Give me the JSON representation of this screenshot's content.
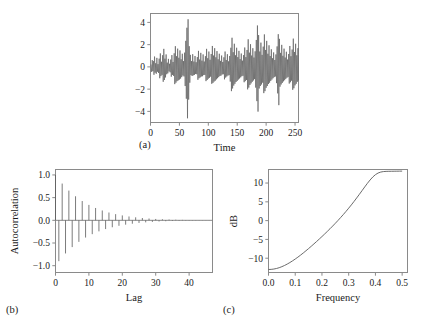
{
  "figure": {
    "background": "#ffffff",
    "line_color": "#5a5a5a",
    "axis_color": "#8a8a8a",
    "text_color": "#1a1a1a"
  },
  "panels": [
    {
      "id": "a",
      "label": "(a)",
      "xlabel": "Time",
      "ylabel": "",
      "xticks": [
        "0",
        "50",
        "100",
        "150",
        "200",
        "250"
      ],
      "yticks": [
        "-4",
        "-2",
        "0",
        "2",
        "4"
      ]
    },
    {
      "id": "b",
      "label": "(b)",
      "xlabel": "Lag",
      "ylabel": "Autocorrelation",
      "xticks": [
        "0",
        "10",
        "20",
        "30",
        "40"
      ],
      "yticks": [
        "1.0",
        "0.5",
        "0.0",
        "-0.5",
        "-1.0"
      ]
    },
    {
      "id": "c",
      "label": "(c)",
      "xlabel": "Frequency",
      "ylabel": "dB",
      "xticks": [
        "0.0",
        "0.1",
        "0.2",
        "0.3",
        "0.4",
        "0.5"
      ],
      "yticks": [
        "10",
        "5",
        "0",
        "-5",
        "-10"
      ]
    }
  ],
  "chart_data": [
    {
      "type": "line",
      "panel": "a",
      "title": "",
      "xlabel": "Time",
      "ylabel": "",
      "xlim": [
        0,
        256
      ],
      "ylim": [
        -5.0,
        4.8
      ],
      "xticks": [
        0,
        50,
        100,
        150,
        200,
        250
      ],
      "yticks": [
        -4,
        -2,
        0,
        2,
        4
      ],
      "grid": false,
      "legend": null,
      "description": "Simulated stationary time series of 256 observations, rapidly oscillating about zero with amplitude envelope mostly within -3 to 3 and occasional excursions to about -4.6 and 4.3.",
      "x": [
        1,
        2,
        3,
        4,
        5,
        6,
        7,
        8,
        9,
        10,
        11,
        12,
        13,
        14,
        15,
        16,
        17,
        18,
        19,
        20,
        21,
        22,
        23,
        24,
        25,
        26,
        27,
        28,
        29,
        30,
        31,
        32,
        33,
        34,
        35,
        36,
        37,
        38,
        39,
        40,
        41,
        42,
        43,
        44,
        45,
        46,
        47,
        48,
        49,
        50,
        51,
        52,
        53,
        54,
        55,
        56,
        57,
        58,
        59,
        60,
        61,
        62,
        63,
        64,
        65,
        66,
        67,
        68,
        69,
        70,
        71,
        72,
        73,
        74,
        75,
        76,
        77,
        78,
        79,
        80,
        81,
        82,
        83,
        84,
        85,
        86,
        87,
        88,
        89,
        90,
        91,
        92,
        93,
        94,
        95,
        96,
        97,
        98,
        99,
        100,
        101,
        102,
        103,
        104,
        105,
        106,
        107,
        108,
        109,
        110,
        111,
        112,
        113,
        114,
        115,
        116,
        117,
        118,
        119,
        120,
        121,
        122,
        123,
        124,
        125,
        126,
        127,
        128,
        129,
        130,
        131,
        132,
        133,
        134,
        135,
        136,
        137,
        138,
        139,
        140,
        141,
        142,
        143,
        144,
        145,
        146,
        147,
        148,
        149,
        150,
        151,
        152,
        153,
        154,
        155,
        156,
        157,
        158,
        159,
        160,
        161,
        162,
        163,
        164,
        165,
        166,
        167,
        168,
        169,
        170,
        171,
        172,
        173,
        174,
        175,
        176,
        177,
        178,
        179,
        180,
        181,
        182,
        183,
        184,
        185,
        186,
        187,
        188,
        189,
        190,
        191,
        192,
        193,
        194,
        195,
        196,
        197,
        198,
        199,
        200,
        201,
        202,
        203,
        204,
        205,
        206,
        207,
        208,
        209,
        210,
        211,
        212,
        213,
        214,
        215,
        216,
        217,
        218,
        219,
        220,
        221,
        222,
        223,
        224,
        225,
        226,
        227,
        228,
        229,
        230,
        231,
        232,
        233,
        234,
        235,
        236,
        237,
        238,
        239,
        240,
        241,
        242,
        243,
        244,
        245,
        246,
        247,
        248,
        249,
        250,
        251,
        252,
        253,
        254,
        255,
        256
      ],
      "values": [
        0.22,
        -0.45,
        0.61,
        -0.38,
        0.52,
        -0.71,
        0.93,
        -0.52,
        0.33,
        -0.62,
        0.81,
        -0.44,
        0.25,
        -0.55,
        0.74,
        -1.02,
        1.21,
        -0.83,
        0.46,
        -0.72,
        1.05,
        -1.34,
        1.62,
        -1.18,
        0.74,
        -0.95,
        1.12,
        -0.66,
        0.38,
        -0.58,
        0.72,
        -0.41,
        0.28,
        -0.49,
        0.66,
        -0.88,
        1.06,
        -0.72,
        0.44,
        -0.81,
        1.22,
        -1.55,
        1.86,
        -1.42,
        0.96,
        -1.28,
        1.64,
        -1.21,
        0.82,
        -1.14,
        1.48,
        -1.05,
        0.68,
        -0.92,
        1.18,
        -0.78,
        0.52,
        -0.86,
        1.28,
        -1.72,
        2.34,
        -2.86,
        3.52,
        -4.62,
        4.28,
        -2.94,
        1.86,
        -1.42,
        1.08,
        -0.74,
        0.52,
        -0.82,
        1.14,
        -0.76,
        0.48,
        -0.72,
        0.98,
        -0.64,
        0.42,
        -0.66,
        0.88,
        -1.16,
        1.44,
        -1.02,
        0.66,
        -0.94,
        1.26,
        -0.86,
        0.56,
        -0.84,
        1.12,
        -0.74,
        0.48,
        -0.72,
        0.96,
        -1.28,
        1.62,
        -1.18,
        0.78,
        -1.06,
        1.38,
        -0.98,
        0.64,
        -0.88,
        1.16,
        -1.52,
        1.88,
        -1.44,
        1.02,
        -1.32,
        1.68,
        -1.24,
        0.86,
        -1.12,
        1.42,
        -1.02,
        0.68,
        -0.92,
        1.18,
        -0.82,
        0.54,
        -0.78,
        1.02,
        -0.68,
        0.44,
        -0.66,
        0.86,
        -1.12,
        1.38,
        -0.96,
        0.62,
        -0.86,
        1.14,
        -0.78,
        0.5,
        -0.74,
        0.98,
        -1.32,
        1.72,
        -2.18,
        2.62,
        -1.94,
        1.32,
        -1.68,
        2.08,
        -1.52,
        1.04,
        -1.36,
        1.72,
        -1.26,
        0.88,
        -1.14,
        1.44,
        -1.04,
        0.7,
        -0.94,
        1.2,
        -0.84,
        0.56,
        -0.8,
        1.06,
        -1.38,
        1.74,
        -1.28,
        0.88,
        -1.18,
        1.52,
        -2.02,
        2.48,
        -1.86,
        1.28,
        -1.62,
        2.04,
        -1.48,
        1.02,
        -1.34,
        1.68,
        -1.22,
        0.84,
        -1.1,
        1.4,
        -1.86,
        2.42,
        -3.08,
        3.72,
        -4.02,
        2.86,
        -1.94,
        1.38,
        -1.72,
        2.18,
        -1.58,
        1.08,
        -1.42,
        1.82,
        -2.36,
        2.92,
        -2.18,
        1.52,
        -1.88,
        2.34,
        -1.72,
        1.18,
        -1.54,
        1.94,
        -1.42,
        0.98,
        -1.26,
        1.58,
        -1.14,
        0.78,
        -1.02,
        1.3,
        -0.92,
        0.62,
        -0.86,
        1.12,
        -1.46,
        1.84,
        -2.38,
        2.94,
        -3.44,
        2.52,
        -1.78,
        1.26,
        -1.58,
        1.98,
        -1.44,
        1.0,
        -1.3,
        1.64,
        -1.2,
        0.84,
        -1.08,
        1.36,
        -0.98,
        0.66,
        -0.9,
        1.16,
        -1.5,
        1.88,
        -1.38,
        0.96,
        -1.24,
        1.56,
        -2.06,
        2.54,
        -1.92,
        1.34,
        -1.66,
        2.08,
        -1.52,
        1.04,
        -1.34,
        1.68,
        -1.22,
        0.86,
        -1.1,
        1.38,
        -0.98,
        0.64
      ]
    },
    {
      "type": "bar",
      "panel": "b",
      "title": "",
      "xlabel": "Lag",
      "ylabel": "Autocorrelation",
      "xlim": [
        0,
        47
      ],
      "ylim": [
        -1.15,
        1.12
      ],
      "xticks": [
        0,
        10,
        20,
        30,
        40
      ],
      "yticks": [
        1.0,
        0.5,
        0.0,
        -0.5,
        -1.0
      ],
      "grid": false,
      "legend": null,
      "description": "Sample autocorrelation function with alternating signs decaying geometrically, typical of an AR(2) process with a dominant negative lag-one coefficient. Spikes drawn as vertical lines from zero.",
      "categories": [
        0,
        1,
        2,
        3,
        4,
        5,
        6,
        7,
        8,
        9,
        10,
        11,
        12,
        13,
        14,
        15,
        16,
        17,
        18,
        19,
        20,
        21,
        22,
        23,
        24,
        25,
        26,
        27,
        28,
        29,
        30,
        31,
        32,
        33,
        34,
        35,
        36,
        37,
        38,
        39,
        40,
        41,
        42,
        43,
        44,
        45,
        46,
        47
      ],
      "values": [
        1.0,
        -0.9,
        0.81,
        -0.73,
        0.655,
        -0.59,
        0.53,
        -0.475,
        0.425,
        -0.38,
        0.34,
        -0.305,
        0.272,
        -0.243,
        0.217,
        -0.193,
        0.172,
        -0.153,
        0.136,
        -0.121,
        0.108,
        -0.096,
        0.085,
        -0.075,
        0.066,
        -0.058,
        0.051,
        -0.045,
        0.04,
        -0.035,
        0.03,
        -0.026,
        0.023,
        -0.02,
        0.017,
        -0.015,
        0.013,
        -0.011,
        0.0095,
        -0.008,
        0.007,
        -0.006,
        0.005,
        -0.0042,
        0.0035,
        -0.003,
        0.0025,
        -0.002
      ]
    },
    {
      "type": "line",
      "panel": "c",
      "title": "",
      "xlabel": "Frequency",
      "ylabel": "dB",
      "xlim": [
        0.0,
        0.52
      ],
      "ylim": [
        -13.8,
        13.6
      ],
      "xticks": [
        0.0,
        0.1,
        0.2,
        0.3,
        0.4,
        0.5
      ],
      "yticks": [
        10,
        5,
        0,
        -5,
        -10
      ],
      "grid": false,
      "legend": null,
      "description": "Theoretical spectral density in decibels, monotonically increasing from about -13 dB at frequency 0 to about +13 dB at frequency 0.5, with sharply rising slope beyond 0.35.",
      "x": [
        0.0,
        0.01,
        0.02,
        0.03,
        0.04,
        0.05,
        0.06,
        0.07,
        0.08,
        0.09,
        0.1,
        0.11,
        0.12,
        0.13,
        0.14,
        0.15,
        0.16,
        0.17,
        0.18,
        0.19,
        0.2,
        0.21,
        0.22,
        0.23,
        0.24,
        0.25,
        0.26,
        0.27,
        0.28,
        0.29,
        0.3,
        0.31,
        0.32,
        0.33,
        0.34,
        0.35,
        0.36,
        0.37,
        0.38,
        0.39,
        0.4,
        0.41,
        0.42,
        0.43,
        0.44,
        0.45,
        0.46,
        0.47,
        0.48,
        0.49,
        0.5
      ],
      "values": [
        -13.0,
        -12.97,
        -12.88,
        -12.73,
        -12.52,
        -12.25,
        -11.93,
        -11.56,
        -11.15,
        -10.7,
        -10.22,
        -9.71,
        -9.17,
        -8.61,
        -8.03,
        -7.43,
        -6.82,
        -6.19,
        -5.55,
        -4.9,
        -4.24,
        -3.56,
        -2.87,
        -2.17,
        -1.45,
        -0.71,
        0.05,
        0.83,
        1.63,
        2.46,
        3.31,
        4.19,
        5.1,
        6.04,
        7.0,
        7.98,
        8.96,
        9.92,
        10.81,
        11.6,
        12.22,
        12.66,
        12.92,
        13.05,
        13.1,
        13.12,
        13.13,
        13.14,
        13.15,
        13.16,
        13.17
      ]
    }
  ]
}
